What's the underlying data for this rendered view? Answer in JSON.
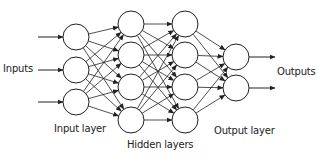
{
  "labels": {
    "inputs": "Inputs",
    "outputs": "Outputs",
    "input_layer": "Input layer",
    "hidden_layers": "Hidden layers",
    "output_layer": "Output layer"
  },
  "style": {
    "stroke": "#222222",
    "node_fill": "#ffffff",
    "background": "#ffffff"
  },
  "network": {
    "node_radius": 13,
    "layers": [
      {
        "name": "input",
        "x": 76,
        "ys": [
          37,
          70,
          102
        ]
      },
      {
        "name": "hidden1",
        "x": 131,
        "ys": [
          24,
          55,
          87,
          120
        ]
      },
      {
        "name": "hidden2",
        "x": 185,
        "ys": [
          24,
          55,
          87,
          120
        ]
      },
      {
        "name": "output",
        "x": 236,
        "ys": [
          57,
          88
        ]
      }
    ],
    "input_arrows": [
      {
        "x1": 38,
        "y": 37
      },
      {
        "x1": 38,
        "y": 70
      },
      {
        "x1": 38,
        "y": 102
      }
    ],
    "output_arrows": [
      {
        "x2": 275,
        "y": 57
      },
      {
        "x2": 275,
        "y": 88
      }
    ]
  }
}
